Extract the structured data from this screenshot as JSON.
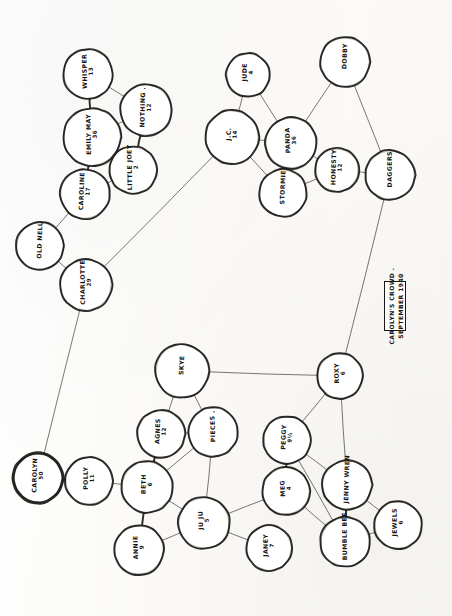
{
  "document": {
    "kind": "hand-drawn-sociogram",
    "caption": {
      "line1": "CAROLYN'S CROWD .",
      "line2": "SEPTEMBER 1940"
    }
  },
  "nodes": [
    {
      "id": "whisper",
      "name": "WHISPER",
      "age": "13",
      "x": 88,
      "y": 74,
      "r": 25,
      "emphasis": false
    },
    {
      "id": "emily_may",
      "name": "EMILY MAY",
      "age": "36",
      "x": 92,
      "y": 137,
      "r": 29,
      "emphasis": false
    },
    {
      "id": "nothing",
      "name": "NOTHING .",
      "age": "12",
      "x": 146,
      "y": 110,
      "r": 26,
      "emphasis": false
    },
    {
      "id": "little_joey",
      "name": "LITTLE JOEY",
      "age": "2",
      "x": 133,
      "y": 170,
      "r": 24,
      "emphasis": false
    },
    {
      "id": "caroline",
      "name": "CAROLINE",
      "age": "17",
      "x": 85,
      "y": 194,
      "r": 25,
      "emphasis": false
    },
    {
      "id": "old_nell",
      "name": "OLD NELL",
      "age": "",
      "x": 40,
      "y": 246,
      "r": 24,
      "emphasis": false
    },
    {
      "id": "charlotte",
      "name": "CHARLOTTE",
      "age": "29",
      "x": 86,
      "y": 285,
      "r": 26,
      "emphasis": false
    },
    {
      "id": "jude",
      "name": "JUDE",
      "age": "4",
      "x": 248,
      "y": 75,
      "r": 22,
      "emphasis": false
    },
    {
      "id": "jc",
      "name": "J.C.",
      "age": "14",
      "x": 232,
      "y": 137,
      "r": 27,
      "emphasis": false
    },
    {
      "id": "panda",
      "name": "PANDA",
      "age": "36",
      "x": 291,
      "y": 143,
      "r": 26,
      "emphasis": false
    },
    {
      "id": "stormie",
      "name": "STORMIE",
      "age": "",
      "x": 283,
      "y": 193,
      "r": 24,
      "emphasis": false
    },
    {
      "id": "honesty",
      "name": "HONESTY",
      "age": "12",
      "x": 337,
      "y": 170,
      "r": 22,
      "emphasis": false
    },
    {
      "id": "dobby",
      "name": "DOBBY",
      "age": "",
      "x": 345,
      "y": 62,
      "r": 25,
      "emphasis": false
    },
    {
      "id": "daggers",
      "name": "DAGGERS",
      "age": "",
      "x": 390,
      "y": 175,
      "r": 25,
      "emphasis": false
    },
    {
      "id": "roxy",
      "name": "ROXY",
      "age": "6",
      "x": 340,
      "y": 376,
      "r": 23,
      "emphasis": false
    },
    {
      "id": "skye",
      "name": "SKYE",
      "age": "",
      "x": 182,
      "y": 371,
      "r": 27,
      "emphasis": false
    },
    {
      "id": "agnes",
      "name": "AGNES",
      "age": "12",
      "x": 161,
      "y": 434,
      "r": 24,
      "emphasis": false
    },
    {
      "id": "pieces",
      "name": "PIECES .",
      "age": "",
      "x": 213,
      "y": 432,
      "r": 25,
      "emphasis": false
    },
    {
      "id": "beth",
      "name": "BETH",
      "age": "6",
      "x": 147,
      "y": 487,
      "r": 26,
      "emphasis": false
    },
    {
      "id": "annie",
      "name": "ANNIE",
      "age": "9",
      "x": 139,
      "y": 550,
      "r": 25,
      "emphasis": false
    },
    {
      "id": "ju_ju",
      "name": "JU JU",
      "age": "5",
      "x": 204,
      "y": 523,
      "r": 26,
      "emphasis": false
    },
    {
      "id": "janey",
      "name": "JANEY",
      "age": "7",
      "x": 269,
      "y": 548,
      "r": 23,
      "emphasis": false
    },
    {
      "id": "meg",
      "name": "MEG",
      "age": "4",
      "x": 286,
      "y": 491,
      "r": 24,
      "emphasis": false
    },
    {
      "id": "peggy",
      "name": "PEGGY",
      "age": "9½",
      "x": 287,
      "y": 440,
      "r": 24,
      "emphasis": false
    },
    {
      "id": "jenny_wren",
      "name": "JENNY WREN",
      "age": "",
      "x": 347,
      "y": 485,
      "r": 25,
      "emphasis": false
    },
    {
      "id": "bumble_bee",
      "name": "BUMBLE BEE",
      "age": "",
      "x": 345,
      "y": 542,
      "r": 25,
      "emphasis": false
    },
    {
      "id": "jewels",
      "name": "JEWELS",
      "age": "6",
      "x": 398,
      "y": 525,
      "r": 24,
      "emphasis": false
    },
    {
      "id": "polly",
      "name": "POLLY",
      "age": "11",
      "x": 89,
      "y": 481,
      "r": 24,
      "emphasis": false
    },
    {
      "id": "carolyn",
      "name": "CAROLYN",
      "age": "50",
      "x": 38,
      "y": 478,
      "r": 25,
      "emphasis": true
    }
  ],
  "edges": [
    {
      "from": "whisper",
      "to": "emily_may",
      "weight": "thick"
    },
    {
      "from": "whisper",
      "to": "nothing",
      "weight": "thin"
    },
    {
      "from": "emily_may",
      "to": "nothing",
      "weight": "thin"
    },
    {
      "from": "emily_may",
      "to": "caroline",
      "weight": "thick"
    },
    {
      "from": "nothing",
      "to": "little_joey",
      "weight": "thick"
    },
    {
      "from": "little_joey",
      "to": "caroline",
      "weight": "thin"
    },
    {
      "from": "caroline",
      "to": "old_nell",
      "weight": "thin"
    },
    {
      "from": "old_nell",
      "to": "charlotte",
      "weight": "thin"
    },
    {
      "from": "charlotte",
      "to": "jc",
      "weight": "thin"
    },
    {
      "from": "charlotte",
      "to": "carolyn",
      "weight": "thin"
    },
    {
      "from": "jude",
      "to": "jc",
      "weight": "thin"
    },
    {
      "from": "jude",
      "to": "panda",
      "weight": "thin"
    },
    {
      "from": "jc",
      "to": "panda",
      "weight": "thin"
    },
    {
      "from": "jc",
      "to": "stormie",
      "weight": "thin"
    },
    {
      "from": "panda",
      "to": "stormie",
      "weight": "thick"
    },
    {
      "from": "panda",
      "to": "honesty",
      "weight": "thin"
    },
    {
      "from": "stormie",
      "to": "honesty",
      "weight": "thin"
    },
    {
      "from": "panda",
      "to": "dobby",
      "weight": "thin"
    },
    {
      "from": "dobby",
      "to": "daggers",
      "weight": "thin"
    },
    {
      "from": "honesty",
      "to": "daggers",
      "weight": "thin"
    },
    {
      "from": "daggers",
      "to": "roxy",
      "weight": "thin"
    },
    {
      "from": "roxy",
      "to": "skye",
      "weight": "thin"
    },
    {
      "from": "roxy",
      "to": "peggy",
      "weight": "thin"
    },
    {
      "from": "roxy",
      "to": "jenny_wren",
      "weight": "thin"
    },
    {
      "from": "skye",
      "to": "agnes",
      "weight": "thin"
    },
    {
      "from": "skye",
      "to": "pieces",
      "weight": "thin"
    },
    {
      "from": "agnes",
      "to": "pieces",
      "weight": "thin"
    },
    {
      "from": "agnes",
      "to": "beth",
      "weight": "thick"
    },
    {
      "from": "pieces",
      "to": "beth",
      "weight": "thin"
    },
    {
      "from": "pieces",
      "to": "ju_ju",
      "weight": "thin"
    },
    {
      "from": "beth",
      "to": "annie",
      "weight": "thick"
    },
    {
      "from": "beth",
      "to": "ju_ju",
      "weight": "thin"
    },
    {
      "from": "annie",
      "to": "ju_ju",
      "weight": "thin"
    },
    {
      "from": "ju_ju",
      "to": "janey",
      "weight": "thin"
    },
    {
      "from": "ju_ju",
      "to": "meg",
      "weight": "thin"
    },
    {
      "from": "peggy",
      "to": "meg",
      "weight": "thick"
    },
    {
      "from": "peggy",
      "to": "bumble_bee",
      "weight": "thin"
    },
    {
      "from": "peggy",
      "to": "jenny_wren",
      "weight": "thin"
    },
    {
      "from": "meg",
      "to": "bumble_bee",
      "weight": "thin"
    },
    {
      "from": "jenny_wren",
      "to": "bumble_bee",
      "weight": "thick"
    },
    {
      "from": "jenny_wren",
      "to": "jewels",
      "weight": "thin"
    },
    {
      "from": "bumble_bee",
      "to": "jewels",
      "weight": "thin"
    },
    {
      "from": "carolyn",
      "to": "polly",
      "weight": "thick"
    },
    {
      "from": "polly",
      "to": "beth",
      "weight": "thin"
    }
  ],
  "caption_box": {
    "x": 384,
    "y": 281,
    "width": 22,
    "height": 50
  },
  "colors": {
    "ink": "#1a1814",
    "paper": "#fdfdfc",
    "node_fill": "#ffffff"
  }
}
